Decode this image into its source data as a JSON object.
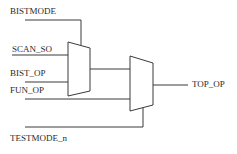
{
  "diagram": {
    "type": "mux-schematic",
    "signals": {
      "bistmode": "BISTMODE",
      "scan_so": "SCAN_SO",
      "bist_op": "BIST_OP",
      "fun_op": "FUN_OP",
      "testmode_n": "TESTMODE_n",
      "top_op": "TOP_OP"
    },
    "components": [
      {
        "id": "mux1",
        "inputs": [
          "SCAN_SO",
          "BIST_OP"
        ],
        "select": "BISTMODE"
      },
      {
        "id": "mux2",
        "inputs": [
          "mux1 output",
          "FUN_OP"
        ],
        "select": "TESTMODE_n",
        "output": "TOP_OP"
      }
    ],
    "colors": {
      "line": "#3a3a3a",
      "text": "#2a2a2a",
      "background": "#ffffff"
    }
  }
}
